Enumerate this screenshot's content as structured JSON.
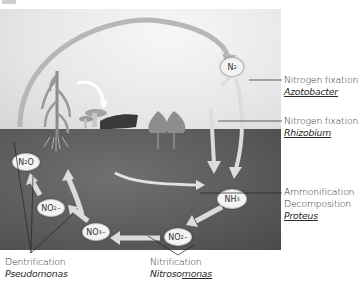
{
  "diagram": {
    "compounds": {
      "n2": {
        "label": "N",
        "sub": "2"
      },
      "n2o": {
        "label_pre": "N",
        "sub": "2",
        "label_post": "O"
      },
      "no2_left": {
        "label": "NO",
        "sub": "2",
        "sup": "−"
      },
      "no3": {
        "label": "NO",
        "sub": "3",
        "sup": "−"
      },
      "no2_bottom": {
        "label": "NO",
        "sub": "2",
        "sup": "−"
      },
      "nh3": {
        "label": "NH",
        "sub": "3"
      }
    },
    "annotations": {
      "fixation_top": {
        "process": "Nitrogen fixation",
        "organism": "Azotobacter"
      },
      "fixation_mid": {
        "process": "Nitrogen fixation",
        "organism": "Rhizobium"
      },
      "ammonification": {
        "process": "Ammonification",
        "process2": "Decomposition",
        "organism": "Proteus"
      },
      "denitrification": {
        "process": "Dentrification",
        "organism": "Pseudomonas"
      },
      "nitrification": {
        "process": "Nitrification",
        "organism_plain": "Nitroso",
        "organism_underlined": "monas"
      }
    },
    "colors": {
      "sky": "#ebebeb",
      "soil": "#5c5c5c",
      "arrow": "#bdbdbd",
      "arrow_light": "#dcdcdc",
      "ink": "#2a2a2a"
    }
  }
}
